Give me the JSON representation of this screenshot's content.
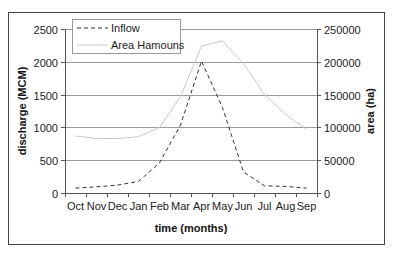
{
  "chart_data": {
    "type": "line",
    "title": "",
    "categories": [
      "Oct",
      "Nov",
      "Dec",
      "Jan",
      "Feb",
      "Mar",
      "Apr",
      "May",
      "Jun",
      "Jul",
      "Aug",
      "Sep"
    ],
    "xlabel": "time (months)",
    "ylabel": "discharge (MCM)",
    "y2label": "area (ha)",
    "ylim": [
      0,
      2500
    ],
    "y2lim": [
      0,
      250000
    ],
    "yticks": [
      "0",
      "500",
      "1000",
      "1500",
      "2000",
      "2500"
    ],
    "y2ticks": [
      "0",
      "50000",
      "100000",
      "150000",
      "200000",
      "250000"
    ],
    "grid": true,
    "legend_position": "top-left",
    "series": [
      {
        "name": "Inflow",
        "axis": "left",
        "style": "dashed",
        "color": "#333333",
        "values": [
          75,
          95,
          120,
          175,
          460,
          1035,
          2010,
          1300,
          320,
          110,
          100,
          75
        ]
      },
      {
        "name": "Area Hamouns",
        "axis": "right",
        "style": "solid",
        "color": "#c8c8c8",
        "values": [
          87000,
          83000,
          83000,
          86000,
          100000,
          147000,
          224000,
          232000,
          197000,
          150000,
          120000,
          97000
        ]
      }
    ]
  }
}
